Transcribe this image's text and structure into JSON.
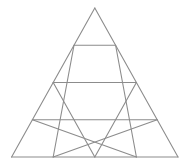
{
  "diagram": {
    "type": "triangular-grid",
    "rows": 4,
    "small_triangle_count": 16,
    "colors": {
      "background": "#ffffff",
      "stroke": "#8c8c8c"
    },
    "outer_triangle": {
      "apex": [
        94.8,
        8
      ],
      "base_left": [
        11.6,
        157
      ],
      "base_right": [
        178,
        157
      ]
    }
  }
}
